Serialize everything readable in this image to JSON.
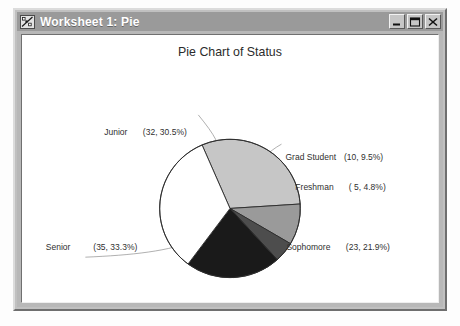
{
  "window": {
    "title": "Worksheet 1: Pie",
    "icon": "worksheet-chart-icon",
    "buttons": {
      "minimize": "Minimize",
      "maximize": "Maximize",
      "close": "Close"
    }
  },
  "colors": {
    "titlebar": "#9a9a9a",
    "window_face": "#c0c0c0",
    "client_background": "#ffffff",
    "slice_outline": "#2a2a2a",
    "leader_line": "#8c8c8c",
    "text": "#2f2f2f"
  },
  "chart_data": {
    "type": "pie",
    "title": "Pie Chart of Status",
    "xlabel": "",
    "ylabel": "",
    "total": 105,
    "legend": "none",
    "grid": false,
    "labels_position": "outside-with-leader-lines",
    "categories": [
      "Junior",
      "Grad Student",
      "Freshman",
      "Sophomore",
      "Senior"
    ],
    "values": [
      32,
      10,
      5,
      23,
      35
    ],
    "percents": [
      30.5,
      9.5,
      4.8,
      21.9,
      33.3
    ],
    "slice_colors": [
      "#c6c6c6",
      "#9a9a9a",
      "#4d4d4d",
      "#1a1a1a",
      "#ffffff"
    ],
    "slices": [
      {
        "name": "Junior",
        "label": "Junior",
        "value": 32,
        "percent": "30.5%",
        "value_text": "(32, 30.5%)",
        "color": "#c6c6c6",
        "start_angle": 246.6,
        "end_angle": 356.4
      },
      {
        "name": "Grad Student",
        "label": "Grad Student",
        "value": 10,
        "percent": "9.5%",
        "value_text": "(10,  9.5%)",
        "color": "#9a9a9a",
        "start_angle": 356.4,
        "end_angle": 390.7
      },
      {
        "name": "Freshman",
        "label": "Freshman",
        "value": 5,
        "percent": "4.8%",
        "value_text": "( 5,  4.8%)",
        "color": "#4d4d4d",
        "start_angle": 390.7,
        "end_angle": 407.8
      },
      {
        "name": "Sophomore",
        "label": "Sophomore",
        "value": 23,
        "percent": "21.9%",
        "value_text": "(23, 21.9%)",
        "color": "#1a1a1a",
        "start_angle": 407.8,
        "end_angle": 486.7
      },
      {
        "name": "Senior",
        "label": "Senior",
        "value": 35,
        "percent": "33.3%",
        "value_text": "(35, 33.3%)",
        "color": "#ffffff",
        "start_angle": 486.7,
        "end_angle": 606.6
      }
    ]
  }
}
